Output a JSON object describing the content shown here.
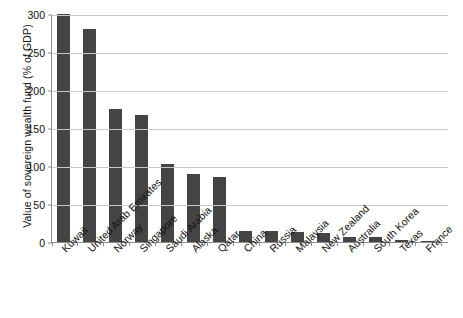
{
  "chart_data": {
    "type": "bar",
    "title": "",
    "xlabel": "",
    "ylabel": "Value of sovereign wealth fund (% of GDP)",
    "ylim": [
      0,
      300
    ],
    "yticks": [
      0,
      50,
      100,
      150,
      200,
      250,
      300
    ],
    "grid": true,
    "legend": false,
    "bar_color": "#444444",
    "axis_color": "#8d8d8d",
    "gridline_color": "#c9c9c9",
    "categories": [
      "Kuwait",
      "United Arab Emirates",
      "Norway",
      "Singapore",
      "Saudi Arabia",
      "Alaska",
      "Qatar",
      "China",
      "Russia",
      "Malaysia",
      "New Zealand",
      "Australia",
      "South Korea",
      "Texas",
      "France"
    ],
    "values": [
      300,
      280,
      175,
      167,
      103,
      89,
      85,
      15,
      14,
      13,
      12,
      7,
      6,
      3,
      1
    ]
  }
}
